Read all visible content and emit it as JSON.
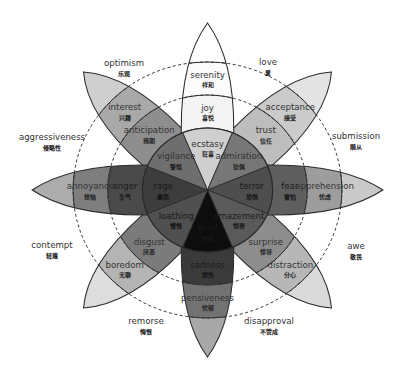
{
  "diagram": {
    "center": [
      207.5,
      190
    ],
    "x_scale": 1.05,
    "radii": {
      "inner": 62,
      "middle": 95,
      "outer": 128,
      "tip": 167
    },
    "petal_half_width": 25,
    "colors": {
      "line": "#2b2b2b",
      "dash": "#333333",
      "background": "#ffffff"
    },
    "petals": [
      {
        "angle": -90,
        "family": "joy",
        "inner": {
          "en": "ecstasy",
          "zh": "狂喜",
          "fill": "#cfcfcf"
        },
        "middle": {
          "en": "joy",
          "zh": "喜悦",
          "fill": "#f4f4f4"
        },
        "outer": {
          "en": "serenity",
          "zh": "祥和",
          "fill": "#fbfbfb"
        },
        "tip_fill": "#ffffff"
      },
      {
        "angle": -45,
        "family": "trust",
        "inner": {
          "en": "admiration",
          "zh": "钦佩",
          "fill": "#777777"
        },
        "middle": {
          "en": "trust",
          "zh": "信任",
          "fill": "#bdbdbd"
        },
        "outer": {
          "en": "acceptance",
          "zh": "接受",
          "fill": "#cbcbcb"
        },
        "tip_fill": "#e3e3e3"
      },
      {
        "angle": 0,
        "family": "fear",
        "inner": {
          "en": "terror",
          "zh": "恐惧",
          "fill": "#4e4e4e"
        },
        "middle": {
          "en": "fear",
          "zh": "害怕",
          "fill": "#5f5f5f"
        },
        "outer": {
          "en": "apprehension",
          "zh": "忧虑",
          "fill": "#9d9d9d"
        },
        "tip_fill": "#c9c9c9"
      },
      {
        "angle": 45,
        "family": "surprise",
        "inner": {
          "en": "amazement",
          "zh": "惊奇",
          "fill": "#5a5a5a"
        },
        "middle": {
          "en": "surprise",
          "zh": "惊讶",
          "fill": "#8d8d8d"
        },
        "outer": {
          "en": "distraction",
          "zh": "分心",
          "fill": "#b7b7b7"
        },
        "tip_fill": "#dadada"
      },
      {
        "angle": 90,
        "family": "sadness",
        "inner": {
          "en": "grief",
          "zh": "悲痛",
          "fill": "#0d0d0d"
        },
        "middle": {
          "en": "sadness",
          "zh": "悲伤",
          "fill": "#3a3a3a"
        },
        "outer": {
          "en": "pensiveness",
          "zh": "忧郁",
          "fill": "#727272"
        },
        "tip_fill": "#a8a8a8"
      },
      {
        "angle": 135,
        "family": "disgust",
        "inner": {
          "en": "loathing",
          "zh": "憎恨",
          "fill": "#505050"
        },
        "middle": {
          "en": "disgust",
          "zh": "厌恶",
          "fill": "#7b7b7b"
        },
        "outer": {
          "en": "boredom",
          "zh": "无聊",
          "fill": "#b4b4b4"
        },
        "tip_fill": "#dddddd"
      },
      {
        "angle": 180,
        "family": "anger",
        "inner": {
          "en": "rage",
          "zh": "暴怒",
          "fill": "#3d3d3d"
        },
        "middle": {
          "en": "anger",
          "zh": "生气",
          "fill": "#4a4a4a"
        },
        "outer": {
          "en": "annoyance",
          "zh": "烦恼",
          "fill": "#7e7e7e"
        },
        "tip_fill": "#adadad"
      },
      {
        "angle": -135,
        "family": "anticipation",
        "inner": {
          "en": "vigilance",
          "zh": "警惕",
          "fill": "#6e6e6e"
        },
        "middle": {
          "en": "anticipation",
          "zh": "预期",
          "fill": "#8e8e8e"
        },
        "outer": {
          "en": "interest",
          "zh": "兴趣",
          "fill": "#a9a9a9"
        },
        "tip_fill": "#cfcfcf"
      }
    ],
    "dyads": [
      {
        "en": "optimism",
        "zh": "乐观",
        "x": 124,
        "y": 66
      },
      {
        "en": "love",
        "zh": "爱",
        "x": 268,
        "y": 65
      },
      {
        "en": "submission",
        "zh": "顺从",
        "x": 356,
        "y": 139
      },
      {
        "en": "awe",
        "zh": "敬畏",
        "x": 356,
        "y": 249
      },
      {
        "en": "disapproval",
        "zh": "不赞成",
        "x": 269,
        "y": 324
      },
      {
        "en": "remorse",
        "zh": "悔恨",
        "x": 146,
        "y": 324
      },
      {
        "en": "contempt",
        "zh": "轻蔑",
        "x": 52,
        "y": 248
      },
      {
        "en": "aggressiveness",
        "zh": "侵略性",
        "x": 52,
        "y": 140
      }
    ]
  }
}
